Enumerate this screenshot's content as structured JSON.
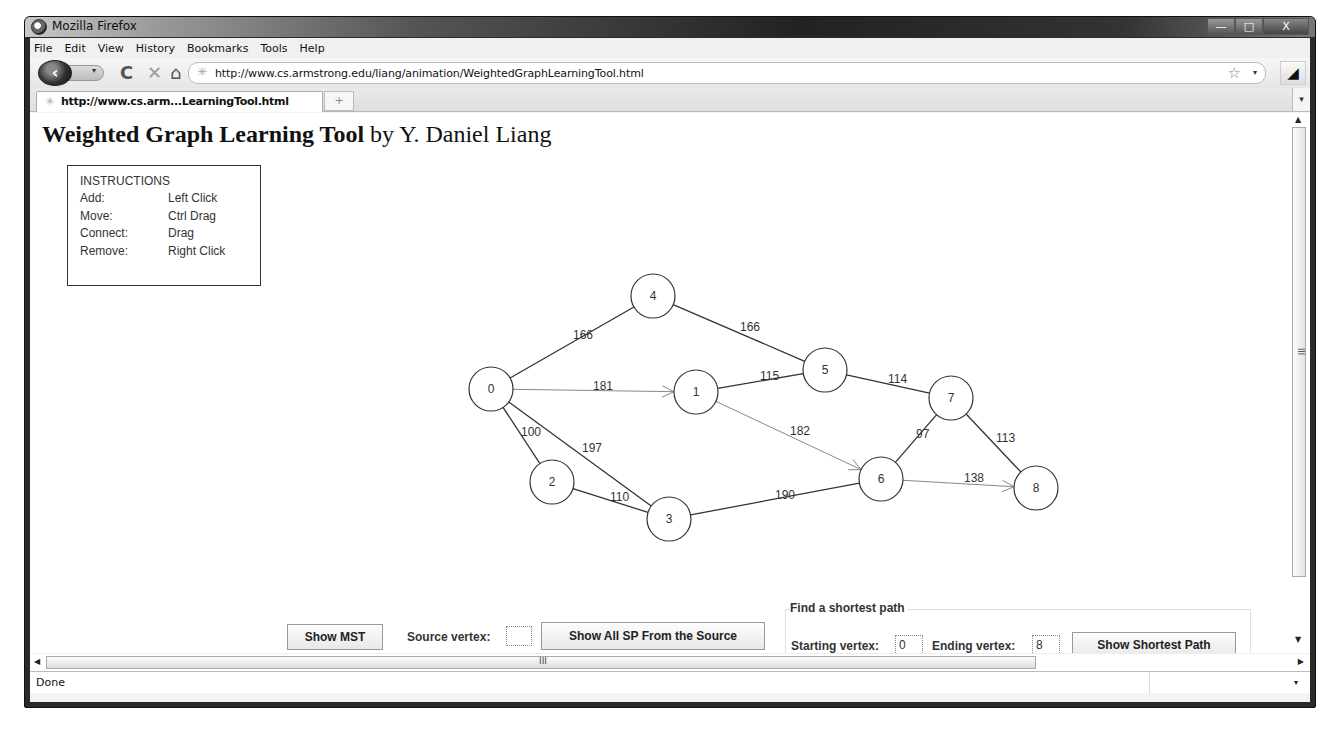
{
  "window": {
    "title": "Mozilla Firefox",
    "controls": {
      "minimize": "—",
      "maximize": "□",
      "close": "X"
    }
  },
  "menubar": {
    "items": [
      {
        "label": "File",
        "accel": "F"
      },
      {
        "label": "Edit",
        "accel": "E"
      },
      {
        "label": "View",
        "accel": "V"
      },
      {
        "label": "History",
        "accel": "s"
      },
      {
        "label": "Bookmarks",
        "accel": "B"
      },
      {
        "label": "Tools",
        "accel": "T"
      },
      {
        "label": "Help",
        "accel": "H"
      }
    ]
  },
  "navbar": {
    "back_icon": "‹",
    "reload_icon": "C",
    "stop_icon": "✕",
    "home_icon": "⌂",
    "url": "http://www.cs.armstrong.edu/liang/animation/WeightedGraphLearningTool.html",
    "star_icon": "☆",
    "dropdown_icon": "▾",
    "addon_icon": "◢"
  },
  "tabs": {
    "active_tab": "http://www.cs.arm...LearningTool.html",
    "new_tab_icon": "+",
    "list_icon": "▾"
  },
  "page": {
    "title_bold": "Weighted Graph Learning Tool",
    "title_rest": " by Y. Daniel Liang",
    "instructions": {
      "heading": "INSTRUCTIONS",
      "rows": [
        {
          "key": "Add:",
          "value": "Left Click"
        },
        {
          "key": "Move:",
          "value": "Ctrl Drag"
        },
        {
          "key": "Connect:",
          "value": "Drag"
        },
        {
          "key": "Remove:",
          "value": "Right Click"
        }
      ]
    },
    "graph": {
      "vertices": [
        {
          "id": "0",
          "x": 461,
          "y": 276
        },
        {
          "id": "1",
          "x": 666,
          "y": 279
        },
        {
          "id": "2",
          "x": 522,
          "y": 369
        },
        {
          "id": "3",
          "x": 639,
          "y": 406
        },
        {
          "id": "4",
          "x": 623,
          "y": 183
        },
        {
          "id": "5",
          "x": 795,
          "y": 257
        },
        {
          "id": "6",
          "x": 851,
          "y": 366
        },
        {
          "id": "7",
          "x": 921,
          "y": 285
        },
        {
          "id": "8",
          "x": 1006,
          "y": 375
        }
      ],
      "edges": [
        {
          "from": "0",
          "to": "4",
          "weight": "166",
          "lx": 543,
          "ly": 226,
          "highlight": false
        },
        {
          "from": "4",
          "to": "5",
          "weight": "166",
          "lx": 710,
          "ly": 218,
          "highlight": false
        },
        {
          "from": "0",
          "to": "1",
          "weight": "181",
          "lx": 563,
          "ly": 277,
          "highlight": true
        },
        {
          "from": "1",
          "to": "5",
          "weight": "115",
          "lx": 730,
          "ly": 267,
          "highlight": false
        },
        {
          "from": "5",
          "to": "7",
          "weight": "114",
          "lx": 858,
          "ly": 270,
          "highlight": false
        },
        {
          "from": "0",
          "to": "2",
          "weight": "100",
          "lx": 491,
          "ly": 323,
          "highlight": false
        },
        {
          "from": "0",
          "to": "3",
          "weight": "197",
          "lx": 552,
          "ly": 339,
          "highlight": false
        },
        {
          "from": "2",
          "to": "3",
          "weight": "110",
          "lx": 580,
          "ly": 388,
          "highlight": false
        },
        {
          "from": "1",
          "to": "6",
          "weight": "182",
          "lx": 760,
          "ly": 322,
          "highlight": true
        },
        {
          "from": "3",
          "to": "6",
          "weight": "190",
          "lx": 745,
          "ly": 386,
          "highlight": false
        },
        {
          "from": "6",
          "to": "7",
          "weight": "97",
          "lx": 886,
          "ly": 325,
          "highlight": false
        },
        {
          "from": "7",
          "to": "8",
          "weight": "113",
          "lx": 966,
          "ly": 329,
          "highlight": false
        },
        {
          "from": "6",
          "to": "8",
          "weight": "138",
          "lx": 934,
          "ly": 369,
          "highlight": true
        }
      ],
      "node_radius": 22
    },
    "controls": {
      "show_mst": "Show MST",
      "source_vertex_label": "Source vertex:",
      "source_vertex_value": "",
      "show_all_sp": "Show All SP From the Source",
      "sp_group_title": "Find a shortest path",
      "starting_vertex_label": "Starting vertex:",
      "starting_vertex_value": "0",
      "ending_vertex_label": "Ending vertex:",
      "ending_vertex_value": "8",
      "show_shortest_path": "Show Shortest Path"
    }
  },
  "scrollbars": {
    "h_grip": "III",
    "v_grip": "III",
    "up": "▲",
    "down": "▼",
    "left": "◀",
    "right": "▶"
  },
  "status": {
    "text": "Done",
    "dropdown_icon": "▾"
  }
}
